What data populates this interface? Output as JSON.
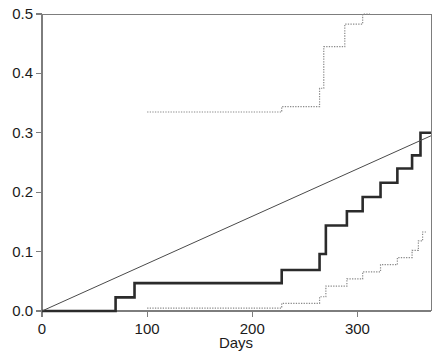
{
  "chart_data": {
    "type": "line",
    "title": "",
    "subtitle": "",
    "xlabel": "Days",
    "ylabel": "",
    "xlim": [
      0,
      370
    ],
    "ylim": [
      0.0,
      0.5
    ],
    "xticks": [
      0,
      100,
      200,
      300
    ],
    "xtick_labels": [
      "0",
      "100",
      "200",
      "300"
    ],
    "yticks": [
      0.0,
      0.1,
      0.2,
      0.3,
      0.4,
      0.5
    ],
    "ytick_labels": [
      "0.0",
      "0.1",
      "0.2",
      "0.3",
      "0.4",
      "0.5"
    ],
    "grid": false,
    "legend": "none",
    "colors": {
      "estimate": "#2b2b2b",
      "confidence_band": "#8a8a8a",
      "reference_line": "#4a4a4a",
      "axis": "#7d7d7d",
      "background": "#ffffff"
    },
    "series": [
      {
        "name": "Cumulative incidence estimate",
        "style": "step-solid-bold",
        "color": "#2b2b2b",
        "width": 2.6,
        "points": [
          [
            0,
            0.0
          ],
          [
            70,
            0.0
          ],
          [
            70,
            0.023
          ],
          [
            88,
            0.023
          ],
          [
            88,
            0.047
          ],
          [
            228,
            0.047
          ],
          [
            228,
            0.069
          ],
          [
            264,
            0.069
          ],
          [
            264,
            0.096
          ],
          [
            270,
            0.096
          ],
          [
            270,
            0.144
          ],
          [
            290,
            0.144
          ],
          [
            290,
            0.168
          ],
          [
            305,
            0.168
          ],
          [
            305,
            0.192
          ],
          [
            322,
            0.192
          ],
          [
            322,
            0.216
          ],
          [
            338,
            0.216
          ],
          [
            338,
            0.24
          ],
          [
            352,
            0.24
          ],
          [
            352,
            0.262
          ],
          [
            360,
            0.262
          ],
          [
            360,
            0.3
          ],
          [
            370,
            0.3
          ]
        ]
      },
      {
        "name": "Upper confidence limit",
        "style": "step-dotted",
        "color": "#8a8a8a",
        "width": 1.2,
        "points": [
          [
            100,
            0.335
          ],
          [
            228,
            0.335
          ],
          [
            228,
            0.344
          ],
          [
            264,
            0.344
          ],
          [
            264,
            0.375
          ],
          [
            268,
            0.375
          ],
          [
            268,
            0.445
          ],
          [
            288,
            0.445
          ],
          [
            288,
            0.483
          ],
          [
            305,
            0.483
          ],
          [
            305,
            0.5
          ],
          [
            312,
            0.5
          ]
        ]
      },
      {
        "name": "Lower confidence limit",
        "style": "step-dotted",
        "color": "#8a8a8a",
        "width": 1.2,
        "points": [
          [
            100,
            0.005
          ],
          [
            228,
            0.005
          ],
          [
            228,
            0.013
          ],
          [
            264,
            0.013
          ],
          [
            264,
            0.024
          ],
          [
            270,
            0.024
          ],
          [
            270,
            0.042
          ],
          [
            290,
            0.042
          ],
          [
            290,
            0.054
          ],
          [
            305,
            0.054
          ],
          [
            305,
            0.066
          ],
          [
            322,
            0.066
          ],
          [
            322,
            0.078
          ],
          [
            338,
            0.078
          ],
          [
            338,
            0.09
          ],
          [
            352,
            0.09
          ],
          [
            352,
            0.102
          ],
          [
            358,
            0.102
          ],
          [
            358,
            0.118
          ],
          [
            362,
            0.118
          ],
          [
            362,
            0.133
          ],
          [
            366,
            0.133
          ]
        ]
      },
      {
        "name": "Linear reference line",
        "style": "line-solid-thin",
        "color": "#4a4a4a",
        "width": 1.0,
        "points": [
          [
            0,
            0.0
          ],
          [
            370,
            0.295
          ]
        ]
      }
    ]
  }
}
